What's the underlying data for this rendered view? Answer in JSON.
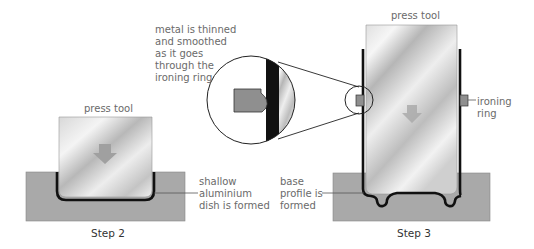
{
  "step2": {
    "press_tool_label": "press tool",
    "dish_label": "shallow\naluminium\ndish is formed",
    "caption": "Step 2"
  },
  "step3": {
    "press_tool_label": "press tool",
    "ironing_ring_label": "ironing\nring",
    "base_label": "base\nprofile is\nformed",
    "caption": "Step 3"
  },
  "callout": {
    "text": "metal is thinned\nand smoothed\nas it goes\nthrough the\nironing ring"
  },
  "colors": {
    "die": "#a9a9a9",
    "metal": "#111111",
    "ring": "#8f8f8f",
    "arrow": "#a0a0a0",
    "label": "#6a6a6a"
  }
}
